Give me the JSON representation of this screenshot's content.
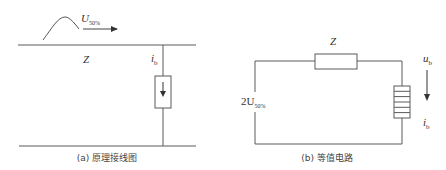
{
  "diagram": {
    "panel_a": {
      "caption": "(a) 原理接线图",
      "wave_label_main": "U",
      "wave_label_sub": "50%",
      "line_impedance_label": "Z",
      "current_label_main": "i",
      "current_label_sub": "b"
    },
    "panel_b": {
      "caption": "(b) 等值电路",
      "impedance_label": "Z",
      "source_label_prefix": "2U",
      "source_label_sub": "50%",
      "voltage_label_main": "u",
      "voltage_label_sub": "b",
      "current_label_main": "i",
      "current_label_sub": "b"
    },
    "colors": {
      "line": "#5a5a5a",
      "text": "#333333"
    }
  }
}
